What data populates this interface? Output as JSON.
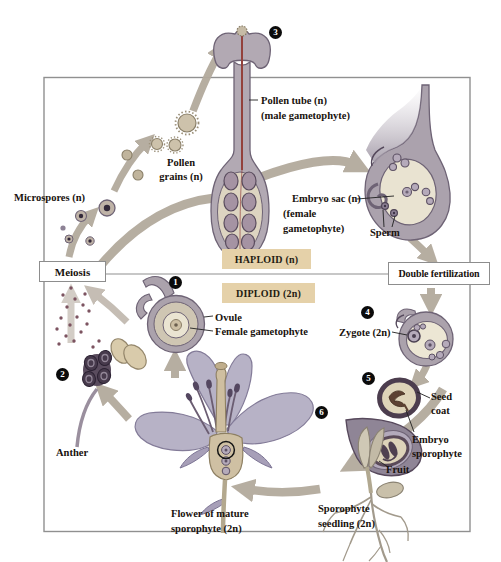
{
  "process_boxes": {
    "meiosis": "Meiosis",
    "double_fertilization": "Double fertilization"
  },
  "phase_bands": {
    "haploid": "HAPLOID (n)",
    "diploid": "DIPLOID (2n)"
  },
  "step_numbers": [
    "1",
    "2",
    "3",
    "4",
    "5",
    "6"
  ],
  "labels": {
    "microspores": "Microspores (n)",
    "pollen_grains": [
      "Pollen",
      "grains (n)"
    ],
    "pollen_tube": [
      "Pollen tube (n)",
      "(male gametophyte)"
    ],
    "embryo_sac": [
      "Embryo sac (n)",
      "(female",
      "gametophyte)"
    ],
    "sperm": "Sperm",
    "ovule": "Ovule",
    "female_gametophyte": "Female gametophyte",
    "anther": "Anther",
    "zygote": "Zygote (2n)",
    "seed_coat": [
      "Seed",
      "coat"
    ],
    "embryo_sporophyte": [
      "Embryo",
      "sporophyte"
    ],
    "fruit": "Fruit",
    "flower": [
      "Flower of mature",
      "sporophyte (2n)"
    ],
    "sporophyte_seedling": [
      "Sporophyte",
      "seedling (2n)"
    ]
  },
  "colors": {
    "phase_band_bg": "#e5d1a9",
    "arrow": "#b3aa9d",
    "structure_outline": "#6e6375",
    "structure_mauve": "#aba2ac",
    "structure_tan": "#ddd4c1",
    "cell_fill": "#b5aaba",
    "anther_sac": "#473a4c",
    "petal": "#b7b2c6",
    "frame_border": "#909090",
    "seed_embryo": "#5d4232"
  }
}
